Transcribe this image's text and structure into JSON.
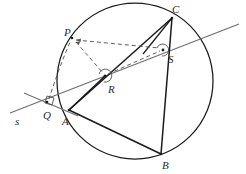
{
  "figure": {
    "width": 246,
    "height": 174,
    "background": "#ffffff",
    "stroke_dark": "#1a1a1a",
    "stroke_gray": "#6f6f6f",
    "stroke_dashed": "#555555",
    "label_color": "#2b2b2b"
  },
  "labels": {
    "P": "P",
    "C": "C",
    "S": "S",
    "R": "R",
    "Q": "Q",
    "A": "A",
    "B": "B",
    "s": "s"
  },
  "label_positions": {
    "P": {
      "x": 64,
      "y": 27
    },
    "C": {
      "x": 172,
      "y": 4
    },
    "S": {
      "x": 168,
      "y": 54
    },
    "R": {
      "x": 108,
      "y": 84
    },
    "Q": {
      "x": 43,
      "y": 110
    },
    "A": {
      "x": 62,
      "y": 116
    },
    "B": {
      "x": 162,
      "y": 160
    },
    "s": {
      "x": 15,
      "y": 116
    }
  },
  "geometry": {
    "circle": {
      "cx": 135,
      "cy": 81,
      "r": 78
    },
    "points": {
      "P": {
        "x": 72,
        "y": 38
      },
      "C": {
        "x": 172,
        "y": 18
      },
      "S": {
        "x": 163,
        "y": 50
      },
      "R": {
        "x": 105,
        "y": 76
      },
      "Q": {
        "x": 47,
        "y": 102
      },
      "A": {
        "x": 69,
        "y": 110
      },
      "B": {
        "x": 161,
        "y": 154
      }
    },
    "line_s": {
      "x1": 10,
      "y1": 113,
      "x2": 239,
      "y2": 24
    },
    "tangent_at_Q": {
      "x1": 24,
      "y1": 93,
      "x2": 78,
      "y2": 116
    },
    "solid_segments": [
      {
        "from": "A",
        "to": "C"
      },
      {
        "from": "A",
        "to": "B"
      },
      {
        "from": "B",
        "to": "C"
      },
      {
        "from": "A",
        "to": "R"
      }
    ],
    "dashed_segments": [
      {
        "from": "P",
        "to": "S"
      },
      {
        "from": "P",
        "to": "R"
      },
      {
        "from": "R",
        "to": "S"
      },
      {
        "from": "Q",
        "to": "P"
      }
    ],
    "angle_markers": [
      {
        "at": "R",
        "type": "dot-arc"
      },
      {
        "at": "S",
        "type": "dot-arc"
      },
      {
        "at": "Q",
        "type": "right-angle-dot"
      }
    ]
  }
}
